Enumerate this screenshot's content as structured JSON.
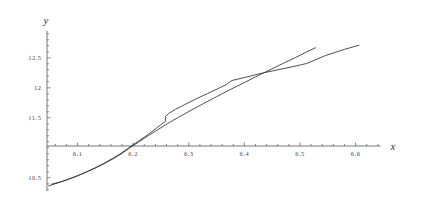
{
  "chart_data": {
    "type": "line",
    "title": "",
    "subtitle": "",
    "xlabel": "x",
    "ylabel": "y",
    "xlim": [
      6.045,
      6.645
    ],
    "ylim": [
      10.28,
      12.95
    ],
    "grid": false,
    "legend": null,
    "axis_origin": {
      "x": 6.045,
      "y": 11.03
    },
    "xticks": [
      6.1,
      6.2,
      6.3,
      6.4,
      6.5,
      6.6
    ],
    "xtick_labels": [
      "6.1",
      "6.2",
      "6.3",
      "6.4",
      "6.5",
      "6.6"
    ],
    "xminor_step": 0.02,
    "yticks": [
      10.5,
      11.5,
      12.0,
      12.5
    ],
    "ytick_labels": [
      "10.5",
      "11.5",
      "12",
      "12.5"
    ],
    "yminor_step": 0.1,
    "series": [
      {
        "name": "curve-1",
        "color": "#303030",
        "points": [
          [
            6.053,
            10.393
          ],
          [
            6.072,
            10.438
          ],
          [
            6.09,
            10.497
          ],
          [
            6.103,
            10.545
          ],
          [
            6.118,
            10.606
          ],
          [
            6.132,
            10.668
          ],
          [
            6.148,
            10.745
          ],
          [
            6.163,
            10.823
          ],
          [
            6.178,
            10.908
          ],
          [
            6.19,
            10.985
          ],
          [
            6.196,
            11.03
          ],
          [
            6.208,
            11.1
          ],
          [
            6.222,
            11.19
          ],
          [
            6.234,
            11.272
          ],
          [
            6.244,
            11.345
          ],
          [
            6.252,
            11.4
          ],
          [
            6.258,
            11.44
          ],
          [
            6.258,
            11.52
          ],
          [
            6.264,
            11.575
          ],
          [
            6.276,
            11.64
          ],
          [
            6.292,
            11.716
          ],
          [
            6.312,
            11.81
          ],
          [
            6.334,
            11.905
          ],
          [
            6.352,
            11.985
          ],
          [
            6.368,
            12.055
          ],
          [
            6.377,
            12.12
          ],
          [
            6.404,
            12.18
          ],
          [
            6.432,
            12.245
          ],
          [
            6.46,
            12.3
          ],
          [
            6.49,
            12.358
          ],
          [
            6.512,
            12.405
          ],
          [
            6.546,
            12.538
          ],
          [
            6.58,
            12.64
          ],
          [
            6.606,
            12.71
          ]
        ]
      },
      {
        "name": "curve-2",
        "color": "#303030",
        "points": [
          [
            6.048,
            10.365
          ],
          [
            6.066,
            10.42
          ],
          [
            6.084,
            10.478
          ],
          [
            6.1,
            10.535
          ],
          [
            6.116,
            10.598
          ],
          [
            6.134,
            10.672
          ],
          [
            6.152,
            10.755
          ],
          [
            6.168,
            10.838
          ],
          [
            6.182,
            10.92
          ],
          [
            6.194,
            11.0
          ],
          [
            6.199,
            11.03
          ],
          [
            6.212,
            11.11
          ],
          [
            6.228,
            11.208
          ],
          [
            6.246,
            11.312
          ],
          [
            6.262,
            11.405
          ],
          [
            6.282,
            11.512
          ],
          [
            6.304,
            11.625
          ],
          [
            6.326,
            11.735
          ],
          [
            6.35,
            11.852
          ],
          [
            6.374,
            11.968
          ],
          [
            6.398,
            12.078
          ],
          [
            6.42,
            12.182
          ],
          [
            6.444,
            12.29
          ],
          [
            6.468,
            12.4
          ],
          [
            6.492,
            12.505
          ],
          [
            6.512,
            12.598
          ],
          [
            6.528,
            12.668
          ]
        ]
      }
    ],
    "annotations": [
      {
        "name": "curve-crossing-at-axis",
        "x": 6.197,
        "y": 11.03
      },
      {
        "name": "curve-crossing-upper",
        "x": 6.444,
        "y": 12.29
      },
      {
        "name": "curve-cusp-lower-left",
        "x": 6.078,
        "y": 10.46
      },
      {
        "name": "step-feature",
        "x": 6.258,
        "y": 11.44
      }
    ]
  }
}
